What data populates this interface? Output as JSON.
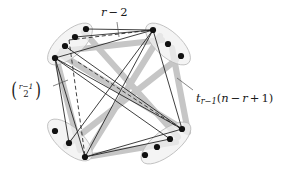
{
  "figure": {
    "background_color": "#ffffff",
    "labels": {
      "top": {
        "name": "r-minus-2",
        "text": "r − 2",
        "parts": {
          "var": "r",
          "op": "−",
          "num": "2"
        },
        "x": 101,
        "y": 7
      },
      "left": {
        "name": "binomial-r-minus-1-choose-2",
        "text": "((r−1) choose 2)",
        "parts": {
          "numerator_var": "r",
          "numerator_op": "−",
          "numerator_num": "1",
          "denominator": "2"
        },
        "x": 10,
        "y": 82
      },
      "right": {
        "name": "t-r-minus-1-of-n-minus-r-plus-1",
        "text": "t_{r−1}(n − r + 1)",
        "parts": {
          "t": "t",
          "t_sub": "r−1",
          "open": "(",
          "n": "n",
          "minus": "−",
          "r": "r",
          "plus": "+",
          "one": "1",
          "close": ")"
        },
        "x": 196,
        "y": 93
      }
    },
    "style": {
      "ellipse_fill": "#f0f0f0",
      "ellipse_stroke": "#b9b9b9",
      "band_color": "#c6c6c6",
      "band_width": 6.2,
      "edge_color": "#1c1c1c",
      "edge_width": 0.85,
      "dashed_color": "#202020",
      "dashed_width": 0.85,
      "dash_pattern": "4,2.6",
      "dot_fill": "#111111",
      "dot_radius": 3.1,
      "leader_color": "#555555",
      "leader_width": 0.7
    },
    "clusters": [
      {
        "name": "cluster-north-west",
        "cx": 70,
        "cy": 44,
        "rx": 28,
        "ry": 12.5,
        "rotate": -42,
        "hub": {
          "x": 55,
          "y": 58
        },
        "dots": [
          {
            "x": 86,
            "y": 29
          },
          {
            "x": 75,
            "y": 37
          },
          {
            "x": 65,
            "y": 46
          }
        ]
      },
      {
        "name": "cluster-north-east",
        "cx": 168,
        "cy": 44,
        "rx": 28,
        "ry": 12.5,
        "rotate": 42,
        "hub": {
          "x": 153,
          "y": 30
        },
        "dots": [
          {
            "x": 168,
            "y": 44
          },
          {
            "x": 181,
            "y": 56
          }
        ]
      },
      {
        "name": "cluster-south-west",
        "cx": 70,
        "cy": 140,
        "rx": 28,
        "ry": 12.5,
        "rotate": 42,
        "hub": {
          "x": 85,
          "y": 157
        },
        "dots": [
          {
            "x": 55,
            "y": 131
          },
          {
            "x": 69,
            "y": 143
          }
        ]
      },
      {
        "name": "cluster-south-east",
        "cx": 166,
        "cy": 143,
        "rx": 30,
        "ry": 12.5,
        "rotate": -38,
        "hub": {
          "x": 182,
          "y": 129
        },
        "dots": [
          {
            "x": 170,
            "y": 139
          },
          {
            "x": 157,
            "y": 147
          },
          {
            "x": 145,
            "y": 155
          }
        ]
      }
    ],
    "bands": [
      {
        "name": "band-nw-to-ne",
        "x1": 62,
        "y1": 51,
        "x2": 162,
        "y2": 40
      },
      {
        "name": "band-nw-to-sw",
        "x1": 56,
        "y1": 57,
        "x2": 80,
        "y2": 150
      },
      {
        "name": "band-ne-to-se",
        "x1": 172,
        "y1": 48,
        "x2": 188,
        "y2": 132
      },
      {
        "name": "band-sw-to-se",
        "x1": 92,
        "y1": 156,
        "x2": 176,
        "y2": 142
      },
      {
        "name": "band-nw-to-se",
        "x1": 60,
        "y1": 54,
        "x2": 186,
        "y2": 131
      },
      {
        "name": "band-ne-to-sw",
        "x1": 160,
        "y1": 36,
        "x2": 88,
        "y2": 152
      },
      {
        "name": "band-nwdot-to-se",
        "x1": 84,
        "y1": 32,
        "x2": 178,
        "y2": 137
      },
      {
        "name": "band-ne-to-swdot",
        "x1": 176,
        "y1": 60,
        "x2": 66,
        "y2": 146
      }
    ],
    "edges": [
      {
        "name": "edge-nwhub-to-nehub",
        "x1": 55,
        "y1": 58,
        "x2": 153,
        "y2": 30
      },
      {
        "name": "edge-nwhub-to-swhub",
        "x1": 55,
        "y1": 58,
        "x2": 85,
        "y2": 157
      },
      {
        "name": "edge-nehub-to-sehub",
        "x1": 153,
        "y1": 30,
        "x2": 182,
        "y2": 129
      },
      {
        "name": "edge-swhub-to-sehub",
        "x1": 85,
        "y1": 157,
        "x2": 182,
        "y2": 129
      },
      {
        "name": "edge-nwhub-to-sehub",
        "x1": 55,
        "y1": 58,
        "x2": 182,
        "y2": 129
      },
      {
        "name": "edge-nehub-to-swhub",
        "x1": 153,
        "y1": 30,
        "x2": 85,
        "y2": 157
      },
      {
        "name": "edge-nwdot1-to-nehub",
        "x1": 86,
        "y1": 29,
        "x2": 153,
        "y2": 30
      },
      {
        "name": "edge-nwdot2-to-nehub",
        "x1": 75,
        "y1": 37,
        "x2": 153,
        "y2": 30
      },
      {
        "name": "edge-nwdot3-to-sehub",
        "x1": 65,
        "y1": 46,
        "x2": 182,
        "y2": 129
      },
      {
        "name": "edge-nwhub-to-swdot",
        "x1": 55,
        "y1": 58,
        "x2": 69,
        "y2": 143
      },
      {
        "name": "edge-nehub-to-swdot",
        "x1": 153,
        "y1": 30,
        "x2": 69,
        "y2": 143
      },
      {
        "name": "edge-swhub-to-sedot",
        "x1": 85,
        "y1": 157,
        "x2": 170,
        "y2": 139
      },
      {
        "name": "edge-nwhub-to-sedot",
        "x1": 55,
        "y1": 58,
        "x2": 170,
        "y2": 139
      }
    ],
    "dashed_edges": [
      {
        "name": "dashed-nwdot-to-nehub",
        "x1": 69,
        "y1": 40,
        "x2": 152,
        "y2": 30
      },
      {
        "name": "dashed-nwdot-to-swhub",
        "x1": 69,
        "y1": 40,
        "x2": 85,
        "y2": 156
      },
      {
        "name": "dashed-nwdot-to-sehub",
        "x1": 78,
        "y1": 62,
        "x2": 181,
        "y2": 129
      }
    ],
    "leaders": [
      {
        "name": "leader-top",
        "x1": 117,
        "y1": 22,
        "x2": 119,
        "y2": 37
      },
      {
        "name": "leader-left",
        "x1": 53,
        "y1": 86,
        "x2": 68,
        "y2": 80
      },
      {
        "name": "leader-right",
        "x1": 193,
        "y1": 90,
        "x2": 177,
        "y2": 78
      }
    ]
  }
}
